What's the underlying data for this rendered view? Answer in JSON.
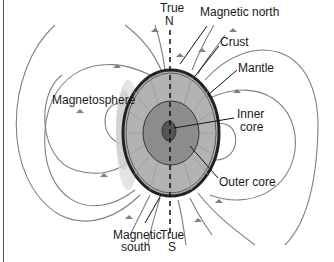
{
  "diagram": {
    "labels": {
      "true_north_1": "True",
      "true_north_2": "N",
      "magnetic_north": "Magnetic north",
      "crust": "Crust",
      "mantle": "Mantle",
      "magnetosphere": "Magnetosphere",
      "inner_core_1": "Inner",
      "inner_core_2": "core",
      "outer_core": "Outer core",
      "magnetic_south_1": "Magnetic",
      "magnetic_south_2": "south",
      "true_south_1": "True",
      "true_south_2": "S"
    },
    "colors": {
      "field_lines": "#7f7f7f",
      "crust_outline": "#222222",
      "mantle": "#b3b3b3",
      "outer_core": "#8c8c8c",
      "inner_core": "#555555",
      "axis": "#111111"
    }
  }
}
